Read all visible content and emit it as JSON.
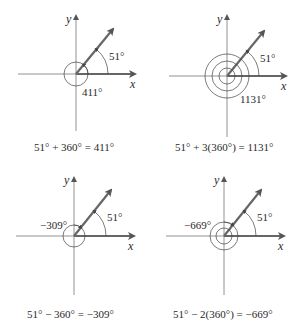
{
  "panels": [
    {
      "axis_x_label": "x",
      "axis_y_label": "y",
      "reference_angle_label": "51°",
      "coterminal_angle_label": "411°",
      "equation": "51° + 360° = 411°",
      "full_rotations": 1,
      "direction": "counterclockwise"
    },
    {
      "axis_x_label": "x",
      "axis_y_label": "y",
      "reference_angle_label": "51°",
      "coterminal_angle_label": "1131°",
      "equation": "51° + 3(360°) = 1131°",
      "full_rotations": 3,
      "direction": "counterclockwise"
    },
    {
      "axis_x_label": "x",
      "axis_y_label": "y",
      "reference_angle_label": "51°",
      "coterminal_angle_label": "−309°",
      "equation": "51° − 360° = −309°",
      "full_rotations": 1,
      "direction": "clockwise"
    },
    {
      "axis_x_label": "x",
      "axis_y_label": "y",
      "reference_angle_label": "51°",
      "coterminal_angle_label": "−669°",
      "equation": "51° − 2(360°) = −669°",
      "full_rotations": 2,
      "direction": "clockwise"
    }
  ],
  "colors": {
    "ray": "#555555",
    "axis": "#555555",
    "arc": "#444444",
    "text": "#2a2a2a"
  }
}
